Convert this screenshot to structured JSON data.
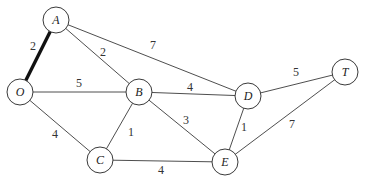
{
  "diagram": {
    "type": "weighted-undirected-graph",
    "colors": {
      "edge": "#3a3a3a",
      "highlight_edge": "#111111",
      "node_fill": "#ffffff",
      "background": "#ffffff"
    },
    "nodes": [
      {
        "id": "A",
        "label": "A",
        "x": 56,
        "y": 20
      },
      {
        "id": "O",
        "label": "O",
        "x": 20,
        "y": 92
      },
      {
        "id": "B",
        "label": "B",
        "x": 139,
        "y": 92
      },
      {
        "id": "C",
        "label": "C",
        "x": 100,
        "y": 160
      },
      {
        "id": "D",
        "label": "D",
        "x": 248,
        "y": 96
      },
      {
        "id": "E",
        "label": "E",
        "x": 225,
        "y": 162
      },
      {
        "id": "T",
        "label": "T",
        "x": 345,
        "y": 72
      }
    ],
    "edges": [
      {
        "from": "A",
        "to": "O",
        "weight": "2",
        "highlight": true,
        "lx": 33,
        "ly": 50
      },
      {
        "from": "A",
        "to": "B",
        "weight": "2",
        "highlight": false,
        "lx": 103,
        "ly": 56
      },
      {
        "from": "A",
        "to": "D",
        "weight": "7",
        "highlight": false,
        "lx": 153,
        "ly": 49
      },
      {
        "from": "O",
        "to": "B",
        "weight": "5",
        "highlight": false,
        "lx": 79,
        "ly": 87
      },
      {
        "from": "O",
        "to": "C",
        "weight": "4",
        "highlight": false,
        "lx": 55,
        "ly": 138
      },
      {
        "from": "B",
        "to": "D",
        "weight": "4",
        "highlight": false,
        "lx": 190,
        "ly": 91
      },
      {
        "from": "B",
        "to": "C",
        "weight": "1",
        "highlight": false,
        "lx": 131,
        "ly": 136
      },
      {
        "from": "B",
        "to": "E",
        "weight": "3",
        "highlight": false,
        "lx": 186,
        "ly": 124
      },
      {
        "from": "C",
        "to": "E",
        "weight": "4",
        "highlight": false,
        "lx": 161,
        "ly": 174
      },
      {
        "from": "D",
        "to": "E",
        "weight": "1",
        "highlight": false,
        "lx": 244,
        "ly": 131
      },
      {
        "from": "D",
        "to": "T",
        "weight": "5",
        "highlight": false,
        "lx": 296,
        "ly": 76
      },
      {
        "from": "E",
        "to": "T",
        "weight": "7",
        "highlight": false,
        "lx": 292,
        "ly": 128
      }
    ]
  }
}
